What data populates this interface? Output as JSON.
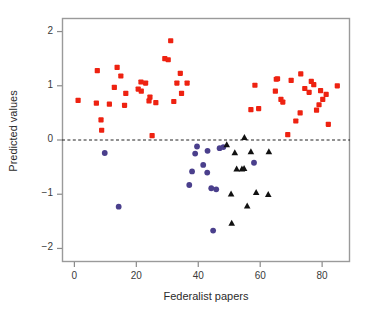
{
  "chart_data": {
    "type": "scatter",
    "title": "",
    "xlabel": "Federalist papers",
    "ylabel": "Predicted values",
    "xlim": [
      -4,
      89
    ],
    "ylim": [
      -2.25,
      2.25
    ],
    "xticks": [
      0,
      20,
      40,
      60,
      80
    ],
    "yticks": [
      2,
      1,
      0,
      -1,
      -2
    ],
    "xtick_labels": [
      "0",
      "20",
      "40",
      "60",
      "80"
    ],
    "ytick_labels": [
      "2",
      "1",
      "0",
      "−1",
      "−2"
    ],
    "grid": false,
    "legend": "none",
    "annotations": [
      {
        "type": "hline",
        "y": 0,
        "style": "dashed",
        "color": "#222222"
      }
    ],
    "series": [
      {
        "name": "red-squares",
        "marker": "square",
        "color": "#ee2211",
        "points": [
          [
            1.2,
            0.73
          ],
          [
            7.1,
            0.68
          ],
          [
            7.4,
            1.28
          ],
          [
            8.6,
            0.37
          ],
          [
            8.8,
            0.18
          ],
          [
            11.3,
            0.66
          ],
          [
            12.9,
            0.97
          ],
          [
            13.8,
            1.34
          ],
          [
            15.0,
            1.18
          ],
          [
            16.2,
            0.64
          ],
          [
            16.6,
            0.86
          ],
          [
            20.6,
            0.94
          ],
          [
            21.6,
            0.9
          ],
          [
            21.5,
            1.07
          ],
          [
            23.0,
            1.05
          ],
          [
            24.1,
            0.72
          ],
          [
            24.4,
            0.79
          ],
          [
            25.1,
            0.08
          ],
          [
            26.3,
            0.69
          ],
          [
            29.2,
            1.5
          ],
          [
            30.3,
            1.48
          ],
          [
            31.1,
            1.83
          ],
          [
            32.1,
            0.71
          ],
          [
            33.1,
            1.05
          ],
          [
            34.2,
            1.23
          ],
          [
            34.6,
            0.86
          ],
          [
            36.4,
            1.05
          ],
          [
            57.0,
            0.56
          ],
          [
            58.3,
            1.01
          ],
          [
            59.5,
            0.58
          ],
          [
            64.9,
            0.9
          ],
          [
            65.2,
            1.12
          ],
          [
            65.6,
            1.13
          ],
          [
            66.7,
            0.75
          ],
          [
            67.3,
            0.7
          ],
          [
            68.9,
            0.1
          ],
          [
            70.0,
            1.1
          ],
          [
            71.5,
            0.35
          ],
          [
            72.9,
            0.5
          ],
          [
            73.1,
            1.22
          ],
          [
            74.4,
            0.95
          ],
          [
            75.8,
            0.88
          ],
          [
            76.5,
            1.08
          ],
          [
            77.3,
            1.02
          ],
          [
            78.2,
            0.55
          ],
          [
            79.0,
            0.65
          ],
          [
            79.5,
            0.91
          ],
          [
            80.2,
            0.75
          ],
          [
            81.3,
            0.84
          ],
          [
            82.0,
            0.29
          ],
          [
            84.9,
            1.0
          ]
        ]
      },
      {
        "name": "blue-circles",
        "marker": "circle",
        "color": "#4a3f8c",
        "points": [
          [
            9.8,
            -0.24
          ],
          [
            14.3,
            -1.23
          ],
          [
            37.1,
            -0.83
          ],
          [
            38.0,
            -0.58
          ],
          [
            39.0,
            -0.25
          ],
          [
            39.6,
            -0.12
          ],
          [
            41.6,
            -0.46
          ],
          [
            42.9,
            -0.6
          ],
          [
            43.0,
            -0.2
          ],
          [
            44.8,
            -1.67
          ],
          [
            44.2,
            -0.89
          ],
          [
            45.8,
            -0.91
          ],
          [
            46.9,
            -0.15
          ],
          [
            48.1,
            -0.13
          ],
          [
            58.0,
            -0.42
          ]
        ]
      },
      {
        "name": "black-triangles",
        "marker": "triangle",
        "color": "#111111",
        "points": [
          [
            49.2,
            -0.09
          ],
          [
            50.6,
            -1.0
          ],
          [
            50.8,
            -1.54
          ],
          [
            51.8,
            -0.24
          ],
          [
            52.4,
            -0.54
          ],
          [
            54.1,
            -0.54
          ],
          [
            54.8,
            -0.53
          ],
          [
            54.9,
            0.04
          ],
          [
            55.8,
            -1.22
          ],
          [
            57.0,
            -0.22
          ],
          [
            58.7,
            -0.97
          ],
          [
            62.6,
            -1.01
          ],
          [
            62.8,
            -0.22
          ]
        ]
      }
    ]
  },
  "figure": {
    "frame_color": "#9a9a9a",
    "background": "#ffffff",
    "tick_color": "#8a8a8a",
    "zero_line_color": "#222222"
  }
}
